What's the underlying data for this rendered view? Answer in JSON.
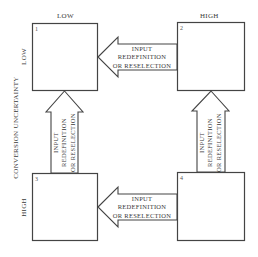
{
  "axes": {
    "top_left_label": "LOW",
    "top_right_label": "HIGH",
    "row1_label": "LOW",
    "row3_label": "HIGH",
    "vertical_axis_title": "CONVERSION UNCERTAINTY"
  },
  "quadrants": [
    {
      "number": "1"
    },
    {
      "number": "2"
    },
    {
      "number": "3"
    },
    {
      "number": "4"
    }
  ],
  "arrows": {
    "top_horizontal": {
      "from": "2",
      "to": "1",
      "lines": [
        "INPUT",
        "REDEFINITION",
        "OR RESELECTION"
      ]
    },
    "bottom_horizontal": {
      "from": "4",
      "to": "3",
      "lines": [
        "INPUT",
        "REDEFINITION",
        "OR RESELECTION"
      ]
    },
    "left_vertical": {
      "from": "3",
      "to": "1",
      "lines": [
        "INPUT",
        "REDEFINITION",
        "OR RESELECTION"
      ]
    },
    "right_vertical": {
      "from": "4",
      "to": "2",
      "lines": [
        "INPUT",
        "REDEFINITION",
        "OR RESELECTION"
      ]
    }
  },
  "colors": {
    "line": "#444444",
    "background": "#ffffff"
  }
}
